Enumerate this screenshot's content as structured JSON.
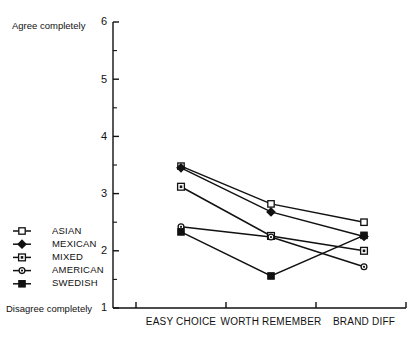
{
  "chart_data": {
    "type": "line",
    "title": "",
    "xlabel": "",
    "ylabel": "",
    "categories": [
      "EASY CHOICE",
      "WORTH REMEMBER",
      "BRAND DIFF"
    ],
    "ylim": [
      1,
      6
    ],
    "yticks": [
      1,
      2,
      3,
      4,
      5,
      6
    ],
    "ytick_labels": [
      "1",
      "2",
      "3",
      "4",
      "5",
      "6"
    ],
    "minor_ticks": [
      1.5,
      2.5,
      3.5,
      4.5,
      5.5
    ],
    "grid": false,
    "legend_position": "lower-left-outside",
    "axis_top_label": "Agree completely",
    "axis_bottom_label": "Disagree completely",
    "series": [
      {
        "name": "ASIAN",
        "marker": "open-square",
        "values": [
          3.48,
          2.82,
          2.5
        ]
      },
      {
        "name": "MEXICAN",
        "marker": "filled-diamond",
        "values": [
          3.45,
          2.68,
          2.25
        ]
      },
      {
        "name": "MIXED",
        "marker": "dotted-square",
        "values": [
          3.12,
          2.26,
          2.0
        ]
      },
      {
        "name": "AMERICAN",
        "marker": "open-circle",
        "values": [
          2.42,
          2.24,
          1.72
        ]
      },
      {
        "name": "SWEDISH",
        "marker": "filled-square",
        "values": [
          2.33,
          1.56,
          2.27
        ]
      }
    ]
  },
  "legend": {
    "items": [
      {
        "label": "ASIAN"
      },
      {
        "label": "MEXICAN"
      },
      {
        "label": "MIXED"
      },
      {
        "label": "AMERICAN"
      },
      {
        "label": "SWEDISH"
      }
    ]
  }
}
